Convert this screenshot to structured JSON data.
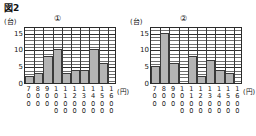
{
  "figure": {
    "title": "図2",
    "y_unit": "(台)",
    "x_unit": "(円)"
  },
  "chart_data": [
    {
      "type": "bar",
      "title": "①",
      "xlabel": "(円)",
      "ylabel": "(台)",
      "categories": [
        "700",
        "800",
        "900",
        "1000",
        "1100",
        "1200",
        "1300",
        "1400",
        "1500",
        "1600"
      ],
      "values": [
        2,
        3,
        8,
        10,
        3,
        4,
        4,
        10,
        6,
        0
      ],
      "yticks": [
        "0",
        "5",
        "10",
        "15"
      ],
      "ylim": [
        0,
        17
      ],
      "grid": true,
      "legend": "none"
    },
    {
      "type": "bar",
      "title": "②",
      "xlabel": "(円)",
      "ylabel": "(台)",
      "categories": [
        "700",
        "800",
        "900",
        "1000",
        "1100",
        "1200",
        "1300",
        "1400",
        "1500",
        "1600"
      ],
      "values": [
        5,
        15,
        6,
        0,
        8,
        2,
        7,
        4,
        3,
        0
      ],
      "yticks": [
        "0",
        "5",
        "10",
        "15"
      ],
      "ylim": [
        0,
        17
      ],
      "grid": true,
      "legend": "none"
    }
  ],
  "colors": {
    "bar_fill": "#b4b4b4",
    "axis": "#2b2b2b",
    "grid": "#6e6e6e"
  }
}
